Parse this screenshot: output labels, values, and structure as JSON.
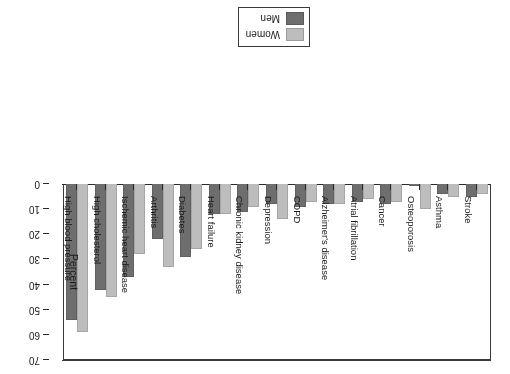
{
  "chart_data": {
    "type": "bar",
    "title": "",
    "subtitle": "",
    "xlabel": "",
    "ylabel": "Percent",
    "ylim": [
      0,
      70
    ],
    "yticks": [
      0,
      10,
      20,
      30,
      40,
      50,
      60,
      70
    ],
    "grid": false,
    "orientation": "vertical-bars-rotated-180",
    "legend_position": "top-center",
    "categories": [
      "Stroke",
      "Asthma",
      "Osteoporosis",
      "Cancer",
      "Atrial fibrillation",
      "Alzheimer's disease",
      "COPD",
      "Depression",
      "Chronic kidney disease",
      "Heart failure",
      "Diabetes",
      "Arthritis",
      "Ischemic heart disease",
      "High cholesterol",
      "High blood pressure"
    ],
    "series": [
      {
        "name": "Women",
        "color": "#bdbdbd",
        "values": [
          4,
          5,
          10,
          7,
          6,
          8,
          7,
          14,
          9,
          12,
          26,
          33,
          28,
          45,
          59
        ]
      },
      {
        "name": "Men",
        "color": "#6e6e6e",
        "values": [
          5,
          4,
          1,
          8,
          7,
          8,
          9,
          8,
          11,
          12,
          29,
          22,
          37,
          42,
          54
        ]
      }
    ]
  },
  "legend": {
    "items": [
      {
        "label": "Women",
        "color": "#bdbdbd"
      },
      {
        "label": "Men",
        "color": "#6e6e6e"
      }
    ]
  },
  "axis": {
    "y_title": "Percent",
    "y_ticks": [
      "0",
      "10",
      "20",
      "30",
      "40",
      "50",
      "60",
      "70"
    ]
  },
  "colors": {
    "women": "#bdbdbd",
    "men": "#6e6e6e",
    "axis": "#2b2b2b",
    "frame": "#3a3a3a",
    "background": "#ffffff"
  }
}
